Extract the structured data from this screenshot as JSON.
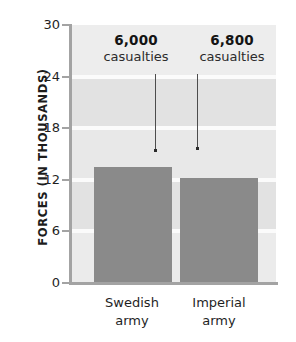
{
  "chart_data": {
    "type": "bar",
    "title": "",
    "xlabel": "",
    "ylabel": "FORCES (IN THOUSANDS)",
    "categories": [
      "Swedish army",
      "Imperial army"
    ],
    "values": [
      13.5,
      12.2
    ],
    "ylim": [
      0,
      30
    ],
    "yticks": [
      0,
      6,
      12,
      18,
      24,
      30
    ],
    "ytick_labels": [
      "0",
      "6",
      "12",
      "18",
      "24",
      "30"
    ],
    "grid": true,
    "legend": false,
    "bar_color": "#8a8a8a",
    "plot_background": "#e9e9e9",
    "annotations": [
      {
        "value": "6,000",
        "unit": "casualties",
        "target_category": "Swedish army"
      },
      {
        "value": "6,800",
        "unit": "casualties",
        "target_category": "Imperial army"
      }
    ]
  },
  "axis": {
    "y_title": "FORCES (IN THOUSANDS)",
    "ticks": [
      {
        "label": "30"
      },
      {
        "label": "24"
      },
      {
        "label": "18"
      },
      {
        "label": "12"
      },
      {
        "label": "6"
      },
      {
        "label": "0"
      }
    ]
  },
  "categories": [
    {
      "line1": "Swedish",
      "line2": "army"
    },
    {
      "line1": "Imperial",
      "line2": "army"
    }
  ],
  "annotations": [
    {
      "value": "6,000",
      "unit": "casualties"
    },
    {
      "value": "6,800",
      "unit": "casualties"
    }
  ]
}
